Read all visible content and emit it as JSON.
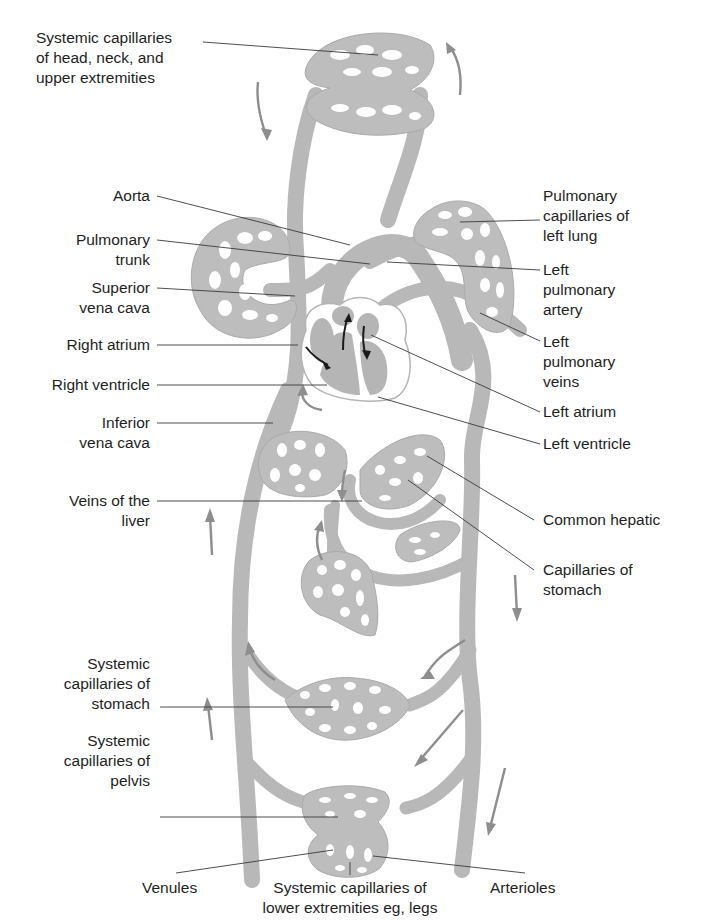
{
  "diagram": {
    "colors": {
      "vessel": "#b8b8b8",
      "capillary_bed": "#bdbdbd",
      "heart": "#b5b5b5",
      "leader_line": "#3a3a3a",
      "flow_arrow": "#8e8e8e",
      "heart_arrow": "#1a1a1a",
      "text": "#1e1e1e",
      "background": "#ffffff"
    },
    "labels_left": [
      {
        "id": "systemic-capillaries-head",
        "text": "Systemic capillaries\nof head, neck, and\nupper extremities"
      },
      {
        "id": "aorta",
        "text": "Aorta"
      },
      {
        "id": "pulmonary-trunk",
        "text": "Pulmonary\ntrunk"
      },
      {
        "id": "superior-vena-cava",
        "text": "Superior\nvena cava"
      },
      {
        "id": "right-atrium",
        "text": "Right atrium"
      },
      {
        "id": "right-ventricle",
        "text": "Right ventricle"
      },
      {
        "id": "inferior-vena-cava",
        "text": "Inferior\nvena cava"
      },
      {
        "id": "veins-of-liver",
        "text": "Veins of the\nliver"
      },
      {
        "id": "systemic-capillaries-stomach",
        "text": "Systemic\ncapillaries of\nstomach"
      },
      {
        "id": "systemic-capillaries-pelvis",
        "text": "Systemic\ncapillaries of\npelvis"
      }
    ],
    "labels_right": [
      {
        "id": "pulmonary-capillaries-left-lung",
        "text": "Pulmonary\ncapillaries of\nleft lung"
      },
      {
        "id": "left-pulmonary-artery",
        "text": "Left\npulmonary\nartery"
      },
      {
        "id": "left-pulmonary-veins",
        "text": "Left\npulmonary\nveins"
      },
      {
        "id": "left-atrium",
        "text": "Left atrium"
      },
      {
        "id": "left-ventricle",
        "text": "Left ventricle"
      },
      {
        "id": "common-hepatic",
        "text": "Common hepatic"
      },
      {
        "id": "capillaries-of-stomach",
        "text": "Capillaries of\nstomach"
      }
    ],
    "labels_bottom": [
      {
        "id": "venules",
        "text": "Venules"
      },
      {
        "id": "systemic-capillaries-lower",
        "text": "Systemic capillaries of\nlower extremities eg, legs"
      },
      {
        "id": "arterioles",
        "text": "Arterioles"
      }
    ]
  }
}
